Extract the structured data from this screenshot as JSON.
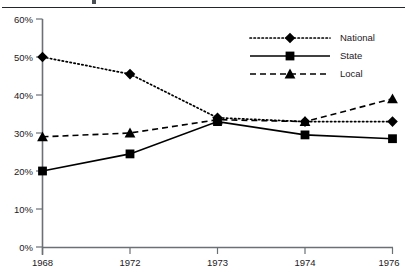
{
  "chart_data": {
    "type": "line",
    "title": "",
    "xlabel": "",
    "ylabel": "",
    "categories": [
      "1968",
      "1972",
      "1973",
      "1974",
      "1976"
    ],
    "ylim": [
      0,
      60
    ],
    "ytick_values": [
      0,
      10,
      20,
      30,
      40,
      50,
      60
    ],
    "ytick_labels": [
      "0%",
      "10%",
      "20%",
      "30%",
      "40%",
      "50%",
      "60%"
    ],
    "grid": false,
    "legend_position": "top-right",
    "series": [
      {
        "name": "National",
        "values": [
          50.0,
          45.5,
          34.0,
          33.0,
          33.0
        ],
        "marker": "diamond",
        "linestyle": "dotted",
        "color": "#000000"
      },
      {
        "name": "State",
        "values": [
          20.0,
          24.5,
          33.0,
          29.5,
          28.5
        ],
        "marker": "square",
        "linestyle": "solid",
        "color": "#000000"
      },
      {
        "name": "Local",
        "values": [
          29.0,
          30.0,
          33.5,
          33.0,
          39.0
        ],
        "marker": "triangle",
        "linestyle": "dashed",
        "color": "#000000"
      }
    ]
  },
  "legend": {
    "entries": [
      {
        "label": "National"
      },
      {
        "label": "State"
      },
      {
        "label": "Local"
      }
    ]
  },
  "axis": {
    "y_ticks": [
      "60%",
      "50%",
      "40%",
      "30%",
      "20%",
      "10%",
      "0%"
    ],
    "x_ticks": [
      "1968",
      "1972",
      "1973",
      "1974",
      "1976"
    ]
  },
  "colors": {
    "ink": "#000000",
    "axis": "#6c7075",
    "rule": "#22262b",
    "background": "#ffffff"
  }
}
